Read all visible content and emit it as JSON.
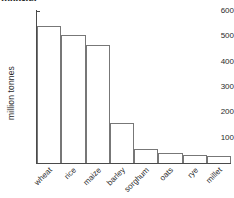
{
  "caption_fragment": "monster.",
  "chart_data": {
    "type": "bar",
    "title": "",
    "xlabel": "",
    "ylabel": "million tonnes",
    "categories": [
      "wheat",
      "rice",
      "maize",
      "barley",
      "sorghum",
      "oats",
      "rye",
      "millet"
    ],
    "values": [
      540,
      505,
      465,
      158,
      55,
      40,
      32,
      28
    ],
    "ylim": [
      0,
      600
    ],
    "yticks": [
      100,
      200,
      300,
      400,
      500,
      600
    ],
    "ytick_labels": [
      "100",
      "200",
      "300",
      "400",
      "500",
      "600"
    ],
    "grid": false,
    "legend": "none",
    "bar_fill": "#ffffff",
    "bar_edge": "#777777",
    "axis_color": "#4a4a4a",
    "background": "#ffffff"
  }
}
